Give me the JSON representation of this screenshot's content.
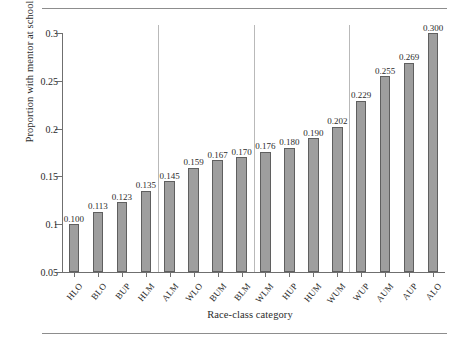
{
  "chart_data": {
    "type": "bar",
    "title": "",
    "xlabel": "Race-class category",
    "ylabel": "Proportion with mentor at school",
    "categories": [
      "HLO",
      "BLO",
      "BUP",
      "HLM",
      "ALM",
      "WLO",
      "BUM",
      "BLM",
      "WLM",
      "HUP",
      "HUM",
      "WUM",
      "WUP",
      "AUM",
      "AUP",
      "ALO"
    ],
    "values": [
      0.1,
      0.113,
      0.123,
      0.135,
      0.145,
      0.159,
      0.167,
      0.17,
      0.176,
      0.18,
      0.19,
      0.202,
      0.229,
      0.255,
      0.269,
      0.3
    ],
    "value_labels": [
      "0.100",
      "0.113",
      "0.123",
      "0.135",
      "0.145",
      "0.159",
      "0.167",
      "0.170",
      "0.176",
      "0.180",
      "0.190",
      "0.202",
      "0.229",
      "0.255",
      "0.269",
      "0.300"
    ],
    "ylim": [
      0.05,
      0.3
    ],
    "yticks": [
      0.05,
      0.1,
      0.15,
      0.2,
      0.25,
      0.3
    ],
    "ytick_labels": [
      "0.05",
      "0.1",
      "0.15",
      "0.2",
      "0.25",
      "0.3"
    ],
    "grid": false,
    "legend": null,
    "group_separators_after": [
      4,
      8,
      12
    ],
    "bar_color": "#9e9e9e",
    "bar_edge_color": "#5f5f5f",
    "axis_color": "#6f6f6f",
    "separator_color": "#b9b9b9"
  }
}
